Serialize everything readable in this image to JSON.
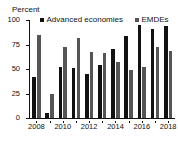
{
  "chart_data": {
    "type": "bar",
    "title": "",
    "ylabel": "Percent",
    "xlabel": "",
    "ylim": [
      0,
      100
    ],
    "yticks": [
      0,
      25,
      50,
      75,
      100
    ],
    "grid": false,
    "legend_position": "top",
    "categories": [
      "2008",
      "2009",
      "2010",
      "2011",
      "2012",
      "2013",
      "2014",
      "2015",
      "2016",
      "2017",
      "2018"
    ],
    "tick_labels_shown": [
      "2008",
      "2010",
      "2012",
      "2014",
      "2016",
      "2018"
    ],
    "series": [
      {
        "name": "Advanced economies",
        "color": "#111111",
        "swatch": "square-marker",
        "values": [
          42,
          5,
          52,
          51,
          45,
          54,
          70,
          84,
          95,
          91,
          94
        ]
      },
      {
        "name": "EMDEs",
        "color": "#555555",
        "swatch": "square-marker",
        "values": [
          85,
          25,
          72,
          82,
          67,
          66,
          57,
          49,
          52,
          72,
          68
        ]
      }
    ]
  }
}
